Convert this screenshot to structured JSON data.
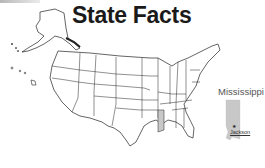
{
  "title": "State Facts",
  "highlighted_state": {
    "name": "Mississippi",
    "capital": "Jackson",
    "fill_color": "#c8c8c8"
  },
  "map": {
    "region": "United States",
    "line_color": "#222222",
    "background": "#ffffff"
  }
}
